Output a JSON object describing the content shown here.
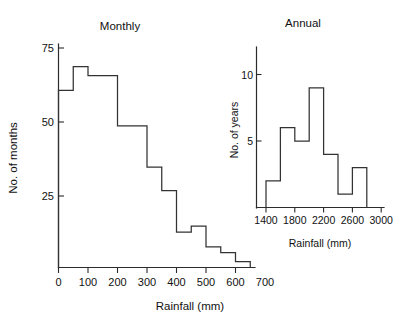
{
  "figure": {
    "background_color": "#ffffff",
    "line_color": "#333333",
    "text_color": "#111111"
  },
  "main_panel": {
    "title": "Monthly",
    "xlabel": "Rainfall (mm)",
    "ylabel": "No. of months",
    "x_ticks": [
      "0",
      "100",
      "200",
      "300",
      "400",
      "500",
      "600",
      "700"
    ],
    "y_ticks": [
      "25",
      "50",
      "75"
    ]
  },
  "inset_panel": {
    "title": "Annual",
    "xlabel": "Rainfall (mm)",
    "ylabel": "No. of years",
    "x_ticks": [
      "1400",
      "1800",
      "2200",
      "2600",
      "3000"
    ],
    "y_ticks": [
      "5",
      "10"
    ]
  },
  "chart_data": [
    {
      "type": "bar",
      "id": "monthly-rainfall-histogram",
      "title": "Monthly",
      "xlabel": "Rainfall (mm)",
      "ylabel": "No. of months",
      "style": "step-histogram",
      "bin_width": 50,
      "bin_edges": [
        0,
        50,
        100,
        150,
        200,
        250,
        300,
        350,
        400,
        450,
        500,
        550,
        600,
        650
      ],
      "categories": [
        "0-50",
        "50-100",
        "100-150",
        "150-200",
        "200-250",
        "250-300",
        "300-350",
        "350-400",
        "400-450",
        "450-500",
        "500-550",
        "550-600",
        "600-650"
      ],
      "values": [
        60,
        68,
        65,
        65,
        48,
        48,
        34,
        26,
        12,
        14,
        7,
        5,
        2
      ],
      "xlim": [
        0,
        700
      ],
      "ylim": [
        0,
        80
      ],
      "x_ticks": [
        0,
        100,
        200,
        300,
        400,
        500,
        600,
        700
      ],
      "y_ticks": [
        25,
        50,
        75
      ],
      "grid": false,
      "legend": "none"
    },
    {
      "type": "bar",
      "id": "annual-rainfall-histogram",
      "title": "Annual",
      "xlabel": "Rainfall (mm)",
      "ylabel": "No. of years",
      "style": "step-histogram",
      "bin_width": 200,
      "bin_edges": [
        1400,
        1600,
        1800,
        2000,
        2200,
        2400,
        2600,
        2800
      ],
      "categories": [
        "1400-1600",
        "1600-1800",
        "1800-2000",
        "2000-2200",
        "2200-2400",
        "2400-2600",
        "2600-2800"
      ],
      "values": [
        2,
        6,
        5,
        9,
        4,
        1,
        3
      ],
      "xlim": [
        1300,
        3100
      ],
      "ylim": [
        0,
        11
      ],
      "x_ticks": [
        1400,
        1800,
        2200,
        2600,
        3000
      ],
      "y_ticks": [
        5,
        10
      ],
      "grid": false,
      "legend": "none"
    }
  ]
}
